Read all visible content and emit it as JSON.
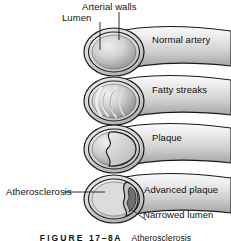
{
  "figure": {
    "caption_label": "FIGURE",
    "caption_number": "17–8A",
    "caption_title": "Atherosclerosis",
    "title": "Atherosclerosis"
  },
  "labels": {
    "arterial_walls": "Arterial walls",
    "lumen": "Lumen",
    "normal_artery": "Normal artery",
    "fatty_streaks": "Fatty streaks",
    "plaque": "Plaque",
    "atherosclerosis": "Atherosclerosis",
    "advanced_plaque": "Advanced plaque",
    "narrowed_lumen": "Narrowed lumen"
  },
  "stages": [
    {
      "id": "normal-artery",
      "order": 1,
      "label": "Normal artery",
      "description": "Open round lumen with smooth arterial walls",
      "lumen_state": "open"
    },
    {
      "id": "fatty-streaks",
      "order": 2,
      "label": "Fatty streaks",
      "description": "Pale curved lipid streaks along the inner wall",
      "lumen_state": "streaked"
    },
    {
      "id": "plaque",
      "order": 3,
      "label": "Plaque",
      "description": "Raised plaque mass bulging into the lumen",
      "lumen_state": "partially narrowed"
    },
    {
      "id": "advanced-plaque",
      "order": 4,
      "label": "Advanced plaque",
      "description": "Large plaque leaving only a narrow crescent lumen",
      "lumen_state": "severely narrowed"
    }
  ],
  "colors": {
    "outline": "#1a1a1a",
    "vessel_light": "#f2f2f2",
    "vessel_mid": "#c9c9c9",
    "vessel_dark": "#9a9a9a",
    "lumen_light": "#e3e3e3",
    "lumen_shadow": "#8e8e8e",
    "plaque_fill": "#d8d8d8",
    "text": "#111111",
    "background": "#ffffff"
  },
  "icons": {
    "leader_line": "leader-line",
    "cross_section": "artery-cross-section-icon"
  }
}
